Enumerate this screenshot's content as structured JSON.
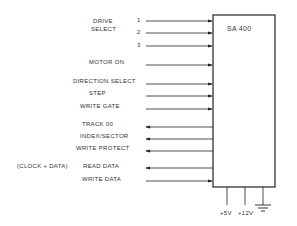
{
  "diagram": {
    "device_label": "SA 400",
    "signals": {
      "drive_select": "DRIVE",
      "drive_select2": "SELECT",
      "pin1": "1",
      "pin2": "2",
      "pin3": "3",
      "motor_on": "MOTOR ON",
      "direction_select": "DIRECTION SELECT",
      "step": "STEP",
      "write_gate": "WRITE GATE",
      "track00": "TRACK 00",
      "index_sector": "INDEX/SECTOR",
      "write_protect": "WRITE PROTECT",
      "clock_data": "(CLOCK + DATA)",
      "read_data": "READ DATA",
      "write_data": "WRITE DATA"
    },
    "power": {
      "v5": "+5V",
      "v12": "+12V"
    }
  }
}
